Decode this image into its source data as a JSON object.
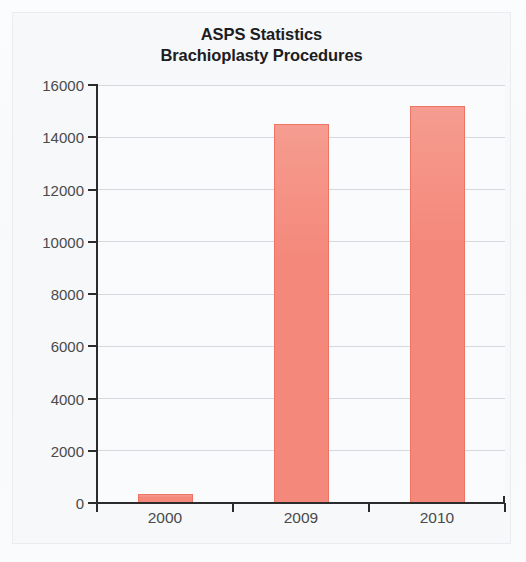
{
  "chart_data": {
    "type": "bar",
    "title": "ASPS Statistics",
    "subtitle": "Brachioplasty Procedures",
    "title_full": "ASPS Statistics Brachioplasty Procedures",
    "categories": [
      "2000",
      "2009",
      "2010"
    ],
    "values": [
      350,
      14500,
      15200
    ],
    "series": [
      {
        "name": "Brachioplasty Procedures",
        "values": [
          350,
          14500,
          15200
        ]
      }
    ],
    "xlabel": "",
    "ylabel": "",
    "ylim": [
      0,
      16000
    ],
    "ytick_step": 2000,
    "yticks": [
      0,
      2000,
      4000,
      6000,
      8000,
      10000,
      12000,
      14000,
      16000
    ],
    "ytick_labels": [
      "0",
      "2000",
      "4000",
      "6000",
      "8000",
      "10000",
      "12000",
      "14000",
      "16000"
    ],
    "grid": true,
    "grid_axis": "y",
    "legend": false,
    "legend_position": "none",
    "bar_color": "#f4897b",
    "bar_border_color": "#ef7466",
    "plot_background": "#f9fbfc",
    "grid_color": "#c6ced6",
    "axis_color": "#2b2b2b",
    "text_color": "#4a4a4a",
    "title_color": "#1d1d1f",
    "frame_color": "#c9cfd4"
  }
}
